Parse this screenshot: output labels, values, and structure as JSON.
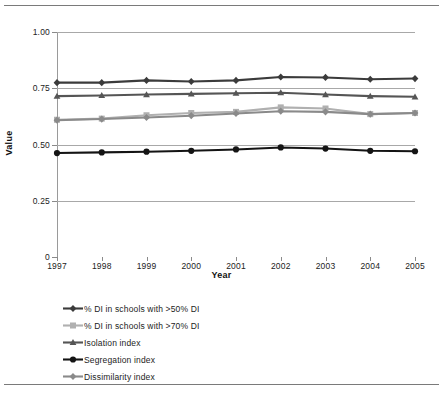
{
  "chart_data": {
    "type": "line",
    "title": "",
    "xlabel": "Year",
    "ylabel": "Value",
    "categories": [
      "1997",
      "1998",
      "1999",
      "2000",
      "2001",
      "2002",
      "2003",
      "2004",
      "2005"
    ],
    "x": [
      1997,
      1998,
      1999,
      2000,
      2001,
      2002,
      2003,
      2004,
      2005
    ],
    "ylim": [
      0,
      1.0
    ],
    "yticks": [
      0,
      0.25,
      0.5,
      0.75,
      1.0
    ],
    "ytick_labels": [
      "0",
      "0.25",
      "0.50",
      "0.75",
      "1.00"
    ],
    "grid": true,
    "legend_position": "below",
    "series": [
      {
        "name": "% DI in schools with >50% DI",
        "marker": "diamond",
        "color": "#3b3b3b",
        "values": [
          0.775,
          0.775,
          0.785,
          0.78,
          0.785,
          0.8,
          0.798,
          0.79,
          0.793
        ]
      },
      {
        "name": "% DI  in schools with >70% DI",
        "marker": "square",
        "color": "#b0b0b0",
        "values": [
          0.61,
          0.615,
          0.63,
          0.64,
          0.645,
          0.665,
          0.66,
          0.635,
          0.64
        ]
      },
      {
        "name": "Isolation index",
        "marker": "triangle",
        "color": "#555555",
        "values": [
          0.715,
          0.718,
          0.722,
          0.725,
          0.728,
          0.73,
          0.722,
          0.715,
          0.712
        ]
      },
      {
        "name": "Segregation index",
        "marker": "circle",
        "color": "#141414",
        "values": [
          0.462,
          0.465,
          0.468,
          0.472,
          0.478,
          0.487,
          0.482,
          0.472,
          0.47
        ]
      },
      {
        "name": "Dissimilarity index",
        "marker": "diamond",
        "color": "#8a8a8a",
        "values": [
          0.608,
          0.613,
          0.62,
          0.628,
          0.638,
          0.648,
          0.645,
          0.635,
          0.64
        ]
      }
    ]
  },
  "axis": {
    "y_title": "Value",
    "x_title": "Year"
  }
}
